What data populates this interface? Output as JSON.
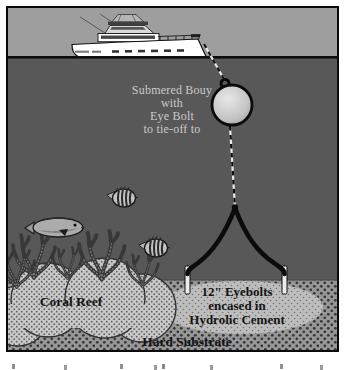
{
  "diagram": {
    "labels": {
      "buoy": [
        "Submered Bouy",
        "with",
        "Eye Bolt",
        "to tie-off to"
      ],
      "coral_reef": "Coral Reef",
      "eyebolts": [
        "12\" Eyebolts",
        "encased in",
        "Hydrolic Cement"
      ],
      "hard_substrate": "Hard Substrate"
    },
    "colors": {
      "sky": "#9e9e9e",
      "water": "#585858",
      "waterline": "#0c0c0c",
      "substrate": "#979797",
      "substrate_dot": "#383838",
      "reef_mound": "#c8c8c8",
      "cement_patch": "#bdbdbd",
      "coral": "#383838",
      "buoy_fill": "#d9d9d9",
      "rope": "#111111",
      "eyebolt": "#ececec",
      "boat_hull": "#ffffff",
      "light_label_text": "#c9c9c9",
      "dark_label_text": "#141414",
      "frame_border": "#0a0a0a"
    }
  }
}
